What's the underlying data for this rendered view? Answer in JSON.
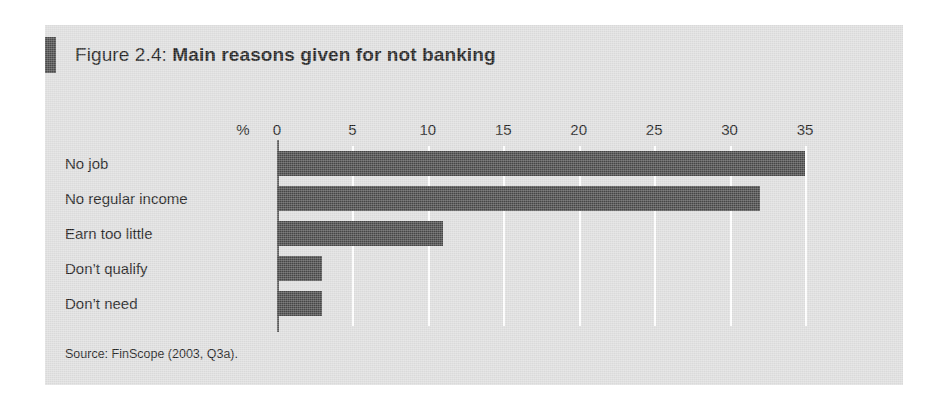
{
  "figure": {
    "title_prefix": "Figure 2.4: ",
    "title_main": "Main reasons given for not banking",
    "source": "Source: FinScope (2003, Q3a).",
    "percent_symbol": "%",
    "panel_bg": "#dedede",
    "bar_color": "#484848",
    "gridline_color": "#ffffff",
    "axis_color": "#5a5a5a",
    "text_color": "#1d1d1d"
  },
  "chart_data": {
    "type": "bar",
    "orientation": "horizontal",
    "title": "Figure 2.4: Main reasons given for not banking",
    "xlabel": "%",
    "ylabel": "",
    "categories": [
      "No job",
      "No regular income",
      "Earn too little",
      "Don’t qualify",
      "Don’t need"
    ],
    "values": [
      35,
      32,
      11,
      3,
      3
    ],
    "series": [
      {
        "name": "Share of respondents",
        "values": [
          35,
          32,
          11,
          3,
          3
        ]
      }
    ],
    "xlim": [
      0,
      35
    ],
    "xticks": [
      0,
      5,
      10,
      15,
      20,
      25,
      30,
      35
    ],
    "xtick_labels": [
      "0",
      "5",
      "10",
      "15",
      "20",
      "25",
      "30",
      "35"
    ],
    "grid": true,
    "grid_axis": "x",
    "legend": false,
    "legend_position": "none",
    "annotations": [
      "Source: FinScope (2003, Q3a)."
    ]
  }
}
